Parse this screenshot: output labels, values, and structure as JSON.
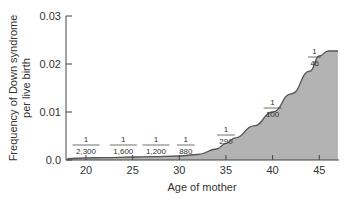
{
  "chart_data": {
    "type": "area",
    "title": "",
    "xlabel": "Age of mother",
    "ylabel_line1": "Frequency of Down syndrome",
    "ylabel_line2": "per live birth",
    "xlim": [
      18,
      47
    ],
    "ylim": [
      0,
      0.03
    ],
    "x_ticks": [
      "20",
      "25",
      "30",
      "35",
      "40",
      "45"
    ],
    "y_ticks": [
      "0.0",
      "0.01",
      "0.02",
      "0.03"
    ],
    "grid": false,
    "legend": null,
    "fill_color": "#b3b3b3",
    "line_color": "#555555",
    "x": [
      18,
      20,
      22,
      25,
      27,
      30,
      32,
      34,
      35,
      36,
      38,
      40,
      42,
      44,
      45,
      46,
      47
    ],
    "values": [
      0.0003,
      0.000435,
      0.0005,
      0.000625,
      0.0007,
      0.000833,
      0.00114,
      0.0023,
      0.00345,
      0.0046,
      0.0071,
      0.01,
      0.0138,
      0.0185,
      0.0217,
      0.0227,
      0.0227
    ],
    "annotations": [
      {
        "age": 20,
        "numerator": "1",
        "denominator": "2,300"
      },
      {
        "age": 24,
        "numerator": "1",
        "denominator": "1,600"
      },
      {
        "age": 27.5,
        "numerator": "1",
        "denominator": "1,200"
      },
      {
        "age": 30.7,
        "numerator": "1",
        "denominator": "880"
      },
      {
        "age": 35,
        "numerator": "1",
        "denominator": "290"
      },
      {
        "age": 40,
        "numerator": "1",
        "denominator": "100"
      },
      {
        "age": 44.5,
        "numerator": "1",
        "denominator": "46"
      }
    ]
  }
}
